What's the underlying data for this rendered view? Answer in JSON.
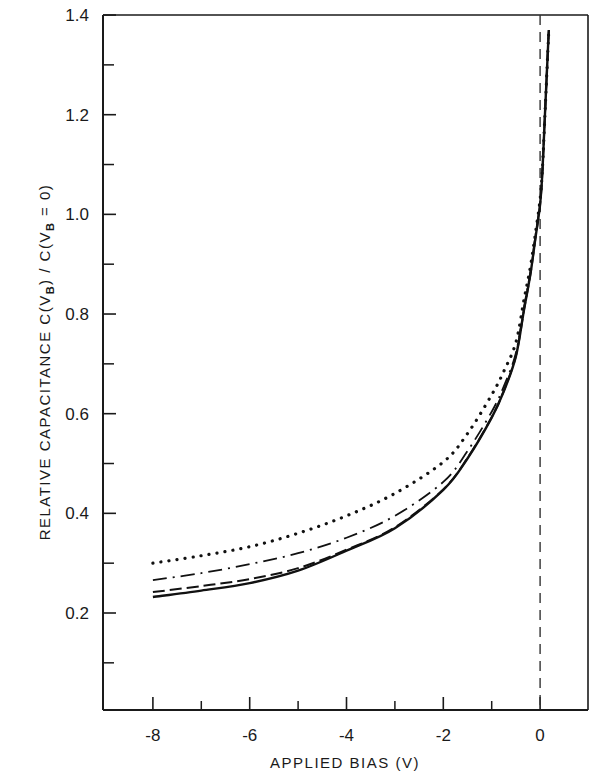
{
  "chart_data": {
    "type": "line",
    "title": "",
    "xlabel": "APPLIED BIAS (V)",
    "ylabel": {
      "prefix": "RELATIVE CAPACITANCE  C(V",
      "sub1": "B",
      "middle": ") / C(V",
      "sub2": "B",
      "suffix": " = 0)"
    },
    "xlim": [
      -9,
      1
    ],
    "ylim": [
      0,
      1.4
    ],
    "xticks": [
      -8,
      -6,
      -4,
      -2,
      0
    ],
    "xtick_labels": [
      "-8",
      "-6",
      "-4",
      "-2",
      "0"
    ],
    "x_minor_ticks": [
      -7,
      -5,
      -3,
      -1
    ],
    "yticks": [
      0.2,
      0.4,
      0.6,
      0.8,
      1.0,
      1.2,
      1.4
    ],
    "ytick_labels": [
      "0.2",
      "0.4",
      "0.6",
      "0.8",
      "1.0",
      "1.2",
      "1.4"
    ],
    "y_minor_ticks": [
      0.1,
      0.3,
      0.5,
      0.7,
      0.9,
      1.1,
      1.3
    ],
    "grid": false,
    "legend": "none",
    "reference_line": {
      "x": 0,
      "style": "dashed"
    },
    "series": [
      {
        "name": "solid",
        "style": "solid",
        "x": [
          -8,
          -7,
          -6,
          -5,
          -4,
          -3,
          -2,
          -1.5,
          -1,
          -0.75,
          -0.5,
          -0.33,
          -0.2,
          -0.1,
          0,
          0.05,
          0.1,
          0.18
        ],
        "values": [
          0.232,
          0.245,
          0.26,
          0.285,
          0.325,
          0.37,
          0.447,
          0.51,
          0.592,
          0.645,
          0.715,
          0.81,
          0.88,
          0.95,
          1.02,
          1.09,
          1.2,
          1.37
        ]
      },
      {
        "name": "dashed",
        "style": "dashed",
        "x": [
          -8,
          -7,
          -6,
          -5,
          -4,
          -3,
          -2,
          -1.5,
          -1,
          -0.75,
          -0.5,
          -0.33,
          -0.2,
          -0.1,
          0,
          0.05,
          0.1,
          0.18
        ],
        "values": [
          0.242,
          0.254,
          0.268,
          0.29,
          0.327,
          0.372,
          0.448,
          0.511,
          0.593,
          0.646,
          0.716,
          0.81,
          0.88,
          0.95,
          1.02,
          1.09,
          1.2,
          1.37
        ]
      },
      {
        "name": "dash-dot",
        "style": "dash-dot",
        "x": [
          -8,
          -7,
          -6,
          -5,
          -4,
          -3,
          -2,
          -1.5,
          -1,
          -0.75,
          -0.5,
          -0.33,
          -0.2,
          -0.1,
          0,
          0.05,
          0.1,
          0.18
        ],
        "values": [
          0.266,
          0.28,
          0.298,
          0.32,
          0.351,
          0.395,
          0.463,
          0.525,
          0.604,
          0.655,
          0.722,
          0.815,
          0.885,
          0.955,
          1.025,
          1.09,
          1.2,
          1.37
        ]
      },
      {
        "name": "dotted",
        "style": "dotted",
        "x": [
          -8,
          -7,
          -6,
          -5,
          -4,
          -3,
          -2,
          -1.5,
          -1,
          -0.75,
          -0.5,
          -0.33,
          -0.2,
          -0.1,
          0,
          0.05,
          0.1,
          0.18
        ],
        "values": [
          0.3,
          0.315,
          0.333,
          0.36,
          0.395,
          0.44,
          0.503,
          0.56,
          0.638,
          0.685,
          0.743,
          0.83,
          0.895,
          0.96,
          1.03,
          1.095,
          1.2,
          1.37
        ]
      }
    ]
  }
}
